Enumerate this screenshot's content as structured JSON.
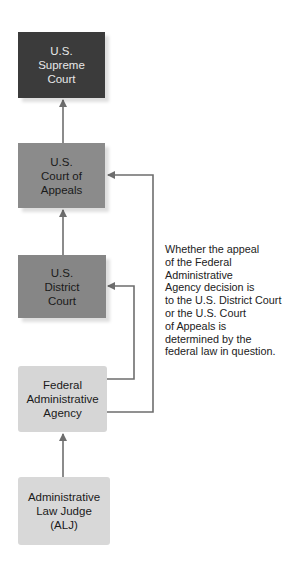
{
  "diagram": {
    "type": "flowchart",
    "direction": "bottom-to-top",
    "nodes": [
      {
        "id": "supreme",
        "label": "U.S.\nSupreme\nCourt",
        "fill": "#3b3b3b",
        "text_color": "#e8e8e8"
      },
      {
        "id": "appeals",
        "label": "U.S.\nCourt of\nAppeals",
        "fill": "#8b8b8b",
        "text_color": "#1a1a1a"
      },
      {
        "id": "district",
        "label": "U.S.\nDistrict\nCourt",
        "fill": "#868686",
        "text_color": "#1a1a1a"
      },
      {
        "id": "agency",
        "label": "Federal\nAdministrative\nAgency",
        "fill": "#d6d6d6",
        "text_color": "#1a1a1a"
      },
      {
        "id": "alj",
        "label": "Administrative\nLaw Judge\n(ALJ)",
        "fill": "#d8d8d8",
        "text_color": "#1a1a1a"
      }
    ],
    "edges": [
      {
        "from": "alj",
        "to": "agency"
      },
      {
        "from": "agency",
        "to": "district"
      },
      {
        "from": "agency",
        "to": "appeals"
      },
      {
        "from": "district",
        "to": "appeals"
      },
      {
        "from": "appeals",
        "to": "supreme"
      }
    ],
    "note": "Whether the appeal\nof the Federal\nAdministrative\nAgency decision is\nto the U.S. District Court\nor the U.S. Court\nof Appeals is\ndetermined by the\nfederal law in question.",
    "line_color": "#6e6e6e"
  }
}
